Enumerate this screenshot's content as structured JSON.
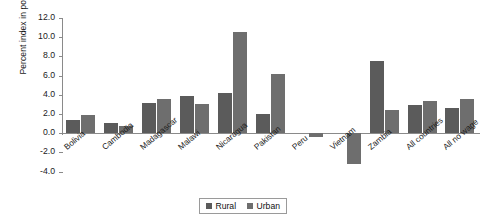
{
  "chart_data": {
    "type": "bar",
    "title": "",
    "xlabel": "",
    "ylabel": "Percent index in poverty rate",
    "ylim": [
      -4.0,
      12.0
    ],
    "ytick_labels": [
      "12.0",
      "10.0",
      "8.0",
      "6.0",
      "4.0",
      "2.0",
      "0.0",
      "-2.0",
      "-4.0"
    ],
    "ytick_values": [
      12.0,
      10.0,
      8.0,
      6.0,
      4.0,
      2.0,
      0.0,
      -2.0,
      -4.0
    ],
    "grid": false,
    "legend_position": "bottom-center",
    "categories": [
      "Bolivia",
      "Cambodia",
      "Madagascar",
      "Malawi",
      "Nicaragua",
      "Pakistan",
      "Peru",
      "Vietnam",
      "Zambia",
      "All countries",
      "All no wage"
    ],
    "series": [
      {
        "name": "Rural",
        "color": "#5b5b5b",
        "values": [
          1.4,
          1.1,
          3.1,
          3.9,
          4.2,
          2.0,
          0.0,
          0.0,
          7.5,
          2.9,
          2.6
        ]
      },
      {
        "name": "Urban",
        "color": "#6e6e6e",
        "values": [
          1.9,
          0.8,
          3.6,
          3.0,
          10.5,
          6.2,
          -0.4,
          -3.2,
          2.4,
          3.4,
          3.6
        ]
      }
    ]
  },
  "legend": {
    "items": [
      {
        "label": "Rural"
      },
      {
        "label": "Urban"
      }
    ]
  }
}
